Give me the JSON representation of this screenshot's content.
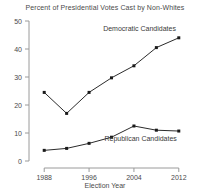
{
  "chart_data": {
    "type": "line",
    "title": "Percent of Presidential Votes Cast by Non-Whites",
    "xlabel": "Election Year",
    "ylabel": "",
    "x": [
      1988,
      1992,
      1996,
      2000,
      2004,
      2008,
      2012
    ],
    "xlim": [
      1986,
      2014
    ],
    "ylim": [
      0,
      50
    ],
    "xticks": [
      1988,
      1996,
      2004,
      2012
    ],
    "xtick_labels": [
      "1988",
      "1996",
      "2004",
      "2012"
    ],
    "yticks": [
      0,
      10,
      20,
      30,
      40,
      50
    ],
    "ytick_labels": [
      "0",
      "10",
      "20",
      "30",
      "40",
      "50"
    ],
    "grid": false,
    "legend_position": "inline-annotations",
    "series": [
      {
        "name": "Democratic Candidates",
        "label_text": "Democratic Candidates",
        "color": "#2b2b2b",
        "marker": "square",
        "values": [
          24.5,
          17.0,
          24.5,
          29.7,
          34.0,
          40.5,
          44.0
        ]
      },
      {
        "name": "Republican Candidates",
        "label_text": "Republican Candidates",
        "color": "#2b2b2b",
        "marker": "square",
        "values": [
          3.8,
          4.5,
          6.3,
          8.5,
          12.5,
          11.0,
          10.7
        ]
      }
    ],
    "annotations": [
      {
        "text": "Democratic Candidates",
        "x": 2005.0,
        "y": 46.5
      },
      {
        "text": "Republican Candidates",
        "x": 2005.2,
        "y": 7.2
      }
    ]
  }
}
